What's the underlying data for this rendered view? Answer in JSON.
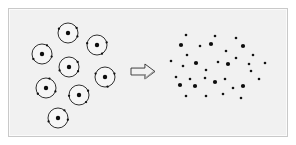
{
  "figure": {
    "background_color": "#ffffff",
    "panel_color": "#f1f1f1",
    "border_color": "#c9c9c9",
    "width": 296,
    "height": 145
  },
  "panel": {
    "x": 8,
    "y": 8,
    "width": 280,
    "height": 129
  },
  "left_group": {
    "label": "encapsulated-particles",
    "description": "Cluster of eight ring-enclosed particles, each ring containing one dark core dot and small specks on the ring perimeter",
    "count": 8,
    "ring_radius": 10,
    "ring_stroke_color": "#1a1a1a",
    "ring_fill_color": "#f6f6f6",
    "core_color": "#0d0d0d",
    "core_radius": 2.2,
    "items": [
      {
        "cx": 59,
        "cy": 24,
        "speck_angles": [
          205,
          330,
          20
        ]
      },
      {
        "cx": 33,
        "cy": 45,
        "speck_angles": [
          150,
          15,
          300
        ]
      },
      {
        "cx": 88,
        "cy": 36,
        "speck_angles": [
          190,
          345,
          60
        ]
      },
      {
        "cx": 60,
        "cy": 58,
        "speck_angles": [
          160,
          330,
          25
        ]
      },
      {
        "cx": 96,
        "cy": 68,
        "speck_angles": [
          200,
          340,
          75
        ]
      },
      {
        "cx": 37,
        "cy": 79,
        "speck_angles": [
          145,
          20,
          290
        ]
      },
      {
        "cx": 70,
        "cy": 86,
        "speck_angles": [
          175,
          335,
          45
        ]
      },
      {
        "cx": 49,
        "cy": 109,
        "speck_angles": [
          160,
          10,
          310
        ]
      }
    ]
  },
  "arrow": {
    "label": "transformation-arrow",
    "direction": "right",
    "x": 122,
    "y": 55,
    "width": 24,
    "height": 15,
    "outline_color": "#2b2b2b",
    "fill_color": "#f2f2f2"
  },
  "right_group": {
    "label": "free-particles",
    "description": "Scattered cloud of released particles of two sizes, no enclosing rings",
    "count": 34,
    "large_count": 11,
    "small_count": 23,
    "large_radius": 2.1,
    "small_radius": 1.3,
    "dot_color": "#0d0d0d",
    "dots": [
      {
        "cx": 185,
        "cy": 34,
        "size": "small"
      },
      {
        "cx": 214,
        "cy": 35,
        "size": "small"
      },
      {
        "cx": 235,
        "cy": 37,
        "size": "small"
      },
      {
        "cx": 180,
        "cy": 44,
        "size": "large"
      },
      {
        "cx": 199,
        "cy": 45,
        "size": "small"
      },
      {
        "cx": 210,
        "cy": 43,
        "size": "large"
      },
      {
        "cx": 242,
        "cy": 45,
        "size": "large"
      },
      {
        "cx": 186,
        "cy": 54,
        "size": "small"
      },
      {
        "cx": 225,
        "cy": 50,
        "size": "small"
      },
      {
        "cx": 252,
        "cy": 54,
        "size": "small"
      },
      {
        "cx": 195,
        "cy": 62,
        "size": "large"
      },
      {
        "cx": 217,
        "cy": 61,
        "size": "small"
      },
      {
        "cx": 227,
        "cy": 63,
        "size": "large"
      },
      {
        "cx": 235,
        "cy": 57,
        "size": "small"
      },
      {
        "cx": 250,
        "cy": 70,
        "size": "small"
      },
      {
        "cx": 182,
        "cy": 65,
        "size": "small"
      },
      {
        "cx": 205,
        "cy": 69,
        "size": "small"
      },
      {
        "cx": 175,
        "cy": 76,
        "size": "small"
      },
      {
        "cx": 179,
        "cy": 84,
        "size": "large"
      },
      {
        "cx": 189,
        "cy": 78,
        "size": "small"
      },
      {
        "cx": 194,
        "cy": 85,
        "size": "large"
      },
      {
        "cx": 204,
        "cy": 77,
        "size": "small"
      },
      {
        "cx": 214,
        "cy": 81,
        "size": "large"
      },
      {
        "cx": 224,
        "cy": 78,
        "size": "small"
      },
      {
        "cx": 232,
        "cy": 87,
        "size": "small"
      },
      {
        "cx": 242,
        "cy": 85,
        "size": "large"
      },
      {
        "cx": 258,
        "cy": 78,
        "size": "small"
      },
      {
        "cx": 185,
        "cy": 95,
        "size": "small"
      },
      {
        "cx": 205,
        "cy": 95,
        "size": "small"
      },
      {
        "cx": 222,
        "cy": 93,
        "size": "small"
      },
      {
        "cx": 240,
        "cy": 97,
        "size": "small"
      },
      {
        "cx": 264,
        "cy": 62,
        "size": "small"
      },
      {
        "cx": 170,
        "cy": 60,
        "size": "small"
      },
      {
        "cx": 248,
        "cy": 63,
        "size": "small"
      }
    ]
  }
}
